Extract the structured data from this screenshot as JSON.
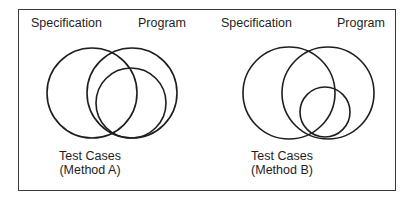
{
  "figure": {
    "border_color": "#3a3a3a",
    "stroke_color": "#1e1e1e",
    "panels": [
      {
        "id": "method-a",
        "labels": {
          "specification": "Specification",
          "program": "Program",
          "test_cases_line1": "Test Cases",
          "test_cases_line2": "(Method A)"
        },
        "circles": [
          {
            "name": "Specification",
            "cx": 92,
            "cy": 93,
            "r": 45
          },
          {
            "name": "Program",
            "cx": 132,
            "cy": 93,
            "r": 45
          },
          {
            "name": "Test Cases (Method A)",
            "cx": 131,
            "cy": 103,
            "r": 35
          }
        ]
      },
      {
        "id": "method-b",
        "labels": {
          "specification": "Specification",
          "program": "Program",
          "test_cases_line1": "Test Cases",
          "test_cases_line2": "(Method B)"
        },
        "circles": [
          {
            "name": "Specification",
            "cx": 289,
            "cy": 93,
            "r": 46
          },
          {
            "name": "Program",
            "cx": 328,
            "cy": 93,
            "r": 46
          },
          {
            "name": "Test Cases (Method B)",
            "cx": 325,
            "cy": 112,
            "r": 25
          }
        ]
      }
    ]
  }
}
